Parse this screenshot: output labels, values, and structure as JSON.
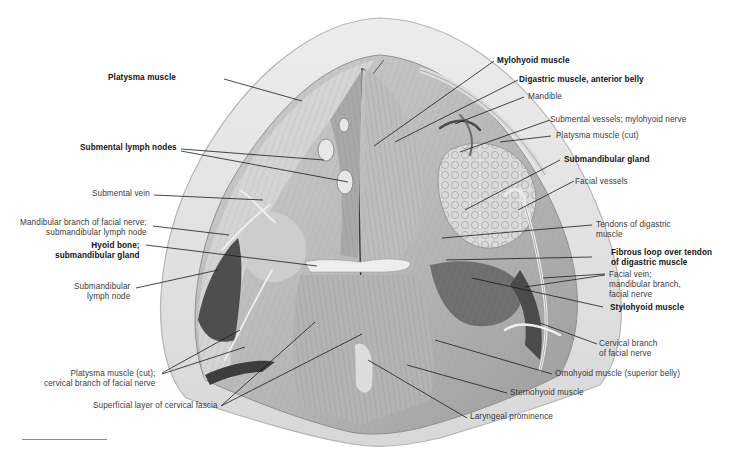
{
  "figure": {
    "type": "anatomical illustration",
    "colors": {
      "skin_rim": "#e6e6e6",
      "tissue_light": "#d0d0d0",
      "tissue_mid": "#a8a8a8",
      "tissue_dark": "#5a5a5a",
      "leader_line": "#1a1a1a",
      "label_text": "#3a3a3a",
      "label_bold_text": "#111111"
    }
  },
  "labels_left": [
    {
      "id": "platysma",
      "lines": [
        "Platysma muscle"
      ],
      "bold": true
    },
    {
      "id": "submental-lymph-nodes",
      "lines": [
        "Submental lymph nodes"
      ],
      "bold": true
    },
    {
      "id": "submental-vein",
      "lines": [
        "Submental vein"
      ],
      "bold": false
    },
    {
      "id": "mandibular-branch",
      "lines": [
        "Mandibular branch of facial nerve;",
        "submandibular lymph node"
      ],
      "bold": false
    },
    {
      "id": "hyoid-bone",
      "lines": [
        "Hyoid bone;",
        "submandibular gland"
      ],
      "bold": true
    },
    {
      "id": "submandibular-lymph-node",
      "lines": [
        "Submandibular",
        "lymph node"
      ],
      "bold": false
    },
    {
      "id": "platysma-cut-cervical",
      "lines": [
        "Platysma muscle (cut);",
        "cervical branch of facial nerve"
      ],
      "bold": false
    },
    {
      "id": "superficial-cervical-fascia",
      "lines": [
        "Superficial layer of cervical fascia"
      ],
      "bold": false
    }
  ],
  "labels_right": [
    {
      "id": "mylohyoid",
      "lines": [
        "Mylohyoid muscle"
      ],
      "bold": true
    },
    {
      "id": "digastric-anterior",
      "lines": [
        "Digastric muscle, anterior belly"
      ],
      "bold": true
    },
    {
      "id": "mandible",
      "lines": [
        "Mandible"
      ],
      "bold": false
    },
    {
      "id": "submental-vessels",
      "lines": [
        "Submental vessels; mylohyoid nerve"
      ],
      "bold": false
    },
    {
      "id": "platysma-cut",
      "lines": [
        "Platysma muscle (cut)"
      ],
      "bold": false
    },
    {
      "id": "submandibular-gland",
      "lines": [
        "Submandibular gland"
      ],
      "bold": true
    },
    {
      "id": "facial-vessels",
      "lines": [
        "Facial vessels"
      ],
      "bold": false
    },
    {
      "id": "tendons-digastric",
      "lines": [
        "Tendons of digastric",
        "muscle"
      ],
      "bold": false
    },
    {
      "id": "fibrous-loop",
      "lines": [
        "Fibrous loop over tendon",
        "of digastric muscle"
      ],
      "bold": true
    },
    {
      "id": "facial-vein",
      "lines": [
        "Facial vein;",
        "mandibular branch,",
        "facial nerve"
      ],
      "bold": false
    },
    {
      "id": "stylohyoid",
      "lines": [
        "Stylohyoid muscle"
      ],
      "bold": true
    },
    {
      "id": "cervical-branch",
      "lines": [
        "Cervical branch",
        "of facial nerve"
      ],
      "bold": false
    },
    {
      "id": "omohyoid",
      "lines": [
        "Omohyoid muscle (superior belly)"
      ],
      "bold": false
    },
    {
      "id": "sternohyoid",
      "lines": [
        "Sternohyoid muscle"
      ],
      "bold": false
    },
    {
      "id": "laryngeal-prominence",
      "lines": [
        "Laryngeal prominence"
      ],
      "bold": false
    }
  ]
}
